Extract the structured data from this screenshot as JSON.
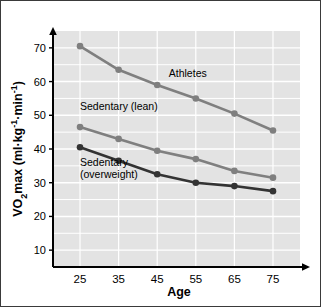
{
  "chart_data": {
    "type": "line",
    "title": "",
    "xlabel": "Age",
    "ylabel": "VO2max (ml·kg-1·min-1)",
    "ylabel_parts": {
      "prefix": "VO",
      "subscript": "2",
      "mid": "max  (ml",
      "dot1": "·",
      "kg": "kg",
      "sup1": "-1",
      "dot2": "·",
      "min": "min",
      "sup2": "-1",
      "close": ")"
    },
    "x": [
      25,
      35,
      45,
      55,
      65,
      75
    ],
    "categories": [
      "25",
      "35",
      "45",
      "55",
      "65",
      "75"
    ],
    "xlim": [
      18,
      82
    ],
    "ylim": [
      5,
      75
    ],
    "yticks": [
      10,
      20,
      30,
      40,
      50,
      60,
      70
    ],
    "ytick_labels": [
      "10",
      "20",
      "30",
      "40",
      "50",
      "60",
      "70"
    ],
    "grid": true,
    "grid_color": "#ffffff",
    "plot_background": "#e3e3e3",
    "legend_position": "inline-annotations",
    "series": [
      {
        "name": "Athletes",
        "label": "Athletes",
        "color": "#7f7f7f",
        "marker": "circle",
        "values": [
          70.5,
          63.5,
          59.0,
          55.0,
          50.5,
          45.5
        ],
        "annotation": {
          "text": "Athletes",
          "x": 48,
          "y": 61.5
        }
      },
      {
        "name": "Sedentary (lean)",
        "label": "Sedentary (lean)",
        "color": "#7f7f7f",
        "marker": "circle",
        "values": [
          46.5,
          43.0,
          39.5,
          37.0,
          33.5,
          31.5
        ],
        "annotation": {
          "text": "Sedentary (lean)",
          "x": 25,
          "y": 51.5
        }
      },
      {
        "name": "Sedentary (overweight)",
        "label": "Sedentary (overweight)",
        "color": "#333333",
        "marker": "circle",
        "values": [
          40.5,
          36.5,
          32.5,
          30.0,
          29.0,
          27.5
        ],
        "annotation": {
          "text_line1": "Sedentary",
          "text_line2": "(overweight)",
          "x": 25,
          "y": 35
        }
      }
    ]
  },
  "figure": {
    "border_color": "#3a3a3a",
    "page_background": "#ffffff"
  }
}
